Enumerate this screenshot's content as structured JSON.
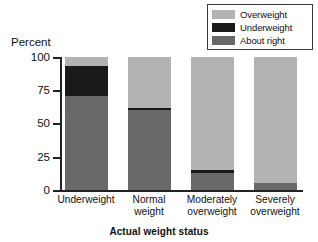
{
  "chart_data": {
    "type": "bar",
    "subtype": "stacked-bar-100-percent",
    "title": "",
    "xlabel": "Actual weight status",
    "ylabel": "Percent",
    "ylim": [
      0,
      100
    ],
    "yticks": [
      0,
      25,
      50,
      75,
      100
    ],
    "ytick_labels": [
      "0",
      "25",
      "50",
      "75",
      "100"
    ],
    "grid": false,
    "legend_position": "top-right",
    "categories": [
      "Underweight",
      "Normal weight",
      "Moderately overweight",
      "Severely overweight"
    ],
    "category_label_lines": [
      [
        "Underweight"
      ],
      [
        "Normal",
        "weight"
      ],
      [
        "Moderately",
        "overweight"
      ],
      [
        "Severely",
        "overweight"
      ]
    ],
    "series": [
      {
        "name": "About right",
        "color": "#686868",
        "values": [
          71,
          60,
          13,
          5
        ]
      },
      {
        "name": "Underweight",
        "color": "#1a1a1a",
        "values": [
          22,
          2,
          2,
          0
        ]
      },
      {
        "name": "Overweight",
        "color": "#b3b3b3",
        "values": [
          7,
          38,
          85,
          95
        ]
      }
    ],
    "stack_order_bottom_to_top": [
      "About right",
      "Underweight",
      "Overweight"
    ]
  },
  "legend": {
    "items": [
      {
        "label": "Overweight",
        "color": "#b3b3b3"
      },
      {
        "label": "Underweight",
        "color": "#1a1a1a"
      },
      {
        "label": "About right",
        "color": "#686868"
      }
    ]
  },
  "axes": {
    "y_title": "Percent",
    "x_title": "Actual weight status",
    "y_tick_0": "0",
    "y_tick_1": "25",
    "y_tick_2": "50",
    "y_tick_3": "75",
    "y_tick_4": "100"
  },
  "x_labels": {
    "c0_l0": "Underweight",
    "c1_l0": "Normal",
    "c1_l1": "weight",
    "c2_l0": "Moderately",
    "c2_l1": "overweight",
    "c3_l0": "Severely",
    "c3_l1": "overweight"
  }
}
